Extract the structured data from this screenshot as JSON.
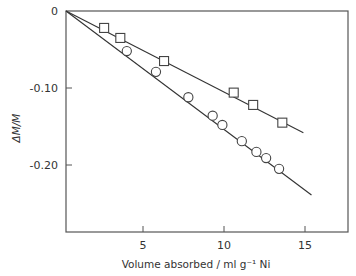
{
  "chart_data": {
    "type": "scatter",
    "title": "",
    "xlabel": "Volume absorbed / ml g⁻¹ Ni",
    "ylabel": "ΔM/M",
    "xlim": [
      0,
      18
    ],
    "ylim": [
      -0.265,
      0
    ],
    "x_ticks": [
      5,
      10,
      15
    ],
    "x_tick_labels": [
      "5",
      "10",
      "15"
    ],
    "y_ticks": [
      0,
      -0.1,
      -0.2
    ],
    "y_tick_labels": [
      "0",
      "-0.10",
      "-0.20"
    ],
    "grid": false,
    "legend": "none",
    "series": [
      {
        "name": "squares",
        "marker": "square",
        "points": [
          {
            "x": 2.6,
            "y": -0.022
          },
          {
            "x": 3.6,
            "y": -0.035
          },
          {
            "x": 6.3,
            "y": -0.065
          },
          {
            "x": 10.6,
            "y": -0.106
          },
          {
            "x": 11.8,
            "y": -0.122
          },
          {
            "x": 13.6,
            "y": -0.145
          }
        ],
        "fit_line": {
          "from": {
            "x": 0,
            "y": 0
          },
          "to": {
            "x": 14.9,
            "y": -0.158
          }
        }
      },
      {
        "name": "circles",
        "marker": "circle",
        "points": [
          {
            "x": 4.0,
            "y": -0.052
          },
          {
            "x": 5.8,
            "y": -0.079
          },
          {
            "x": 7.8,
            "y": -0.112
          },
          {
            "x": 9.3,
            "y": -0.136
          },
          {
            "x": 9.9,
            "y": -0.148
          },
          {
            "x": 11.1,
            "y": -0.169
          },
          {
            "x": 12.0,
            "y": -0.183
          },
          {
            "x": 12.6,
            "y": -0.191
          },
          {
            "x": 13.4,
            "y": -0.205
          }
        ],
        "fit_line": {
          "from": {
            "x": 0,
            "y": 0
          },
          "to": {
            "x": 15.4,
            "y": -0.239
          }
        }
      }
    ]
  }
}
